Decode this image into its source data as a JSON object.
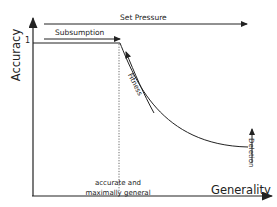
{
  "diagram": {
    "y_axis_label": "Accuracy",
    "x_axis_label": "Generality",
    "y_tick_label": "1",
    "arrows": {
      "set_pressure": "Set Pressure",
      "subsumption": "Subsumption",
      "fitness": "Fitness",
      "deletion": "Deletion"
    },
    "x_marker_label_line1": "accurate and",
    "x_marker_label_line2": "maximally general"
  },
  "colors": {
    "line": "#222222",
    "background": "#ffffff"
  }
}
